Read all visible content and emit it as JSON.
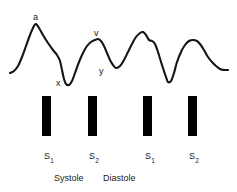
{
  "figure": {
    "background_color": "#ffffff",
    "stroke_color": "#151515",
    "bar_color": "#000000",
    "text_color": "#1a1a1a",
    "width": 237,
    "height": 192
  },
  "chart_data": {
    "type": "line",
    "title": "",
    "xlabel": "",
    "ylabel": "",
    "grid": false,
    "legend": null,
    "axis_visible": false,
    "xlim": [
      0,
      237
    ],
    "ylim": [
      0,
      100
    ],
    "series": [
      {
        "name": "jugular-venous-pressure",
        "points": [
          [
            10,
            73
          ],
          [
            14,
            71
          ],
          [
            18,
            66
          ],
          [
            22,
            57
          ],
          [
            26,
            46
          ],
          [
            30,
            35
          ],
          [
            34,
            26
          ],
          [
            36,
            24
          ],
          [
            39,
            28
          ],
          [
            43,
            35
          ],
          [
            48,
            43
          ],
          [
            53,
            50
          ],
          [
            57,
            55
          ],
          [
            60,
            61
          ],
          [
            62,
            70
          ],
          [
            64,
            79
          ],
          [
            66,
            84
          ],
          [
            69,
            85
          ],
          [
            72,
            81
          ],
          [
            75,
            73
          ],
          [
            79,
            62
          ],
          [
            83,
            53
          ],
          [
            87,
            46
          ],
          [
            91,
            42
          ],
          [
            95,
            40
          ],
          [
            98,
            39
          ],
          [
            101,
            41
          ],
          [
            104,
            46
          ],
          [
            107,
            53
          ],
          [
            110,
            60
          ],
          [
            113,
            65
          ],
          [
            116,
            68
          ],
          [
            120,
            66
          ],
          [
            124,
            60
          ],
          [
            128,
            52
          ],
          [
            132,
            44
          ],
          [
            136,
            37
          ],
          [
            140,
            33
          ],
          [
            143,
            32
          ],
          [
            146,
            35
          ],
          [
            149,
            40
          ],
          [
            152,
            41
          ],
          [
            155,
            44
          ],
          [
            158,
            52
          ],
          [
            162,
            65
          ],
          [
            166,
            77
          ],
          [
            168,
            82
          ],
          [
            171,
            81
          ],
          [
            174,
            73
          ],
          [
            177,
            62
          ],
          [
            181,
            52
          ],
          [
            185,
            45
          ],
          [
            189,
            41
          ],
          [
            193,
            40
          ],
          [
            197,
            41
          ],
          [
            200,
            44
          ],
          [
            204,
            50
          ],
          [
            208,
            57
          ],
          [
            212,
            62
          ],
          [
            216,
            66
          ],
          [
            220,
            69
          ],
          [
            224,
            70
          ],
          [
            228,
            70
          ]
        ]
      }
    ],
    "annotations": [
      {
        "id": "a-wave",
        "label": "a",
        "x": 33,
        "y": 13
      },
      {
        "id": "x-descent",
        "label": "x",
        "x": 56,
        "y": 79
      },
      {
        "id": "v-wave",
        "label": "v",
        "x": 94,
        "y": 29
      },
      {
        "id": "y-descent",
        "label": "y",
        "x": 99,
        "y": 67
      }
    ],
    "heart_sound_bars": [
      {
        "id": "s1-first",
        "label": "S",
        "subscript": "1",
        "x": 42,
        "y": 96,
        "width": 9,
        "height": 40,
        "label_x": 44,
        "label_y": 152
      },
      {
        "id": "s2-first",
        "label": "S",
        "subscript": "2",
        "x": 88,
        "y": 96,
        "width": 9,
        "height": 40,
        "label_x": 89,
        "label_y": 152
      },
      {
        "id": "s1-second",
        "label": "S",
        "subscript": "1",
        "x": 143,
        "y": 96,
        "width": 9,
        "height": 40,
        "label_x": 145,
        "label_y": 152
      },
      {
        "id": "s2-second",
        "label": "S",
        "subscript": "2",
        "x": 188,
        "y": 96,
        "width": 9,
        "height": 40,
        "label_x": 189,
        "label_y": 152
      }
    ],
    "phase_labels": [
      {
        "id": "systole",
        "label": "Systole",
        "x": 54,
        "y": 174
      },
      {
        "id": "diastole",
        "label": "Diastole",
        "x": 103,
        "y": 174
      }
    ]
  }
}
